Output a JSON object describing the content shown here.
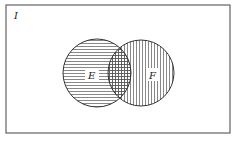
{
  "diagram": {
    "type": "venn",
    "universe_label": "I",
    "sets": [
      {
        "name": "E",
        "label": "E",
        "hatch": "horizontal"
      },
      {
        "name": "F",
        "label": "F",
        "hatch": "vertical"
      }
    ],
    "intersection_hatch": "crosshatch",
    "colors": {
      "line": "#333333",
      "background": "#ffffff"
    }
  }
}
